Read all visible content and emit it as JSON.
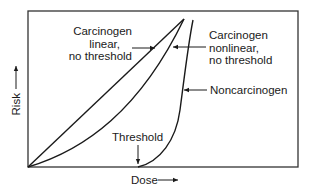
{
  "diagram": {
    "type": "dose-response curves",
    "axes": {
      "x_label": "Dose",
      "y_label": "Risk"
    },
    "curves": [
      {
        "name": "carcinogen-linear",
        "label_lines": [
          "Carcinogen",
          "linear,",
          "no threshold"
        ]
      },
      {
        "name": "carcinogen-nonlinear",
        "label_lines": [
          "Carcinogen",
          "nonlinear,",
          "no threshold"
        ]
      },
      {
        "name": "noncarcinogen",
        "label_lines": [
          "Noncarcinogen"
        ]
      }
    ],
    "annotations": {
      "threshold": "Threshold"
    },
    "colors": {
      "line": "#1a1a1a",
      "frame": "#333333",
      "background": "#ffffff"
    }
  }
}
